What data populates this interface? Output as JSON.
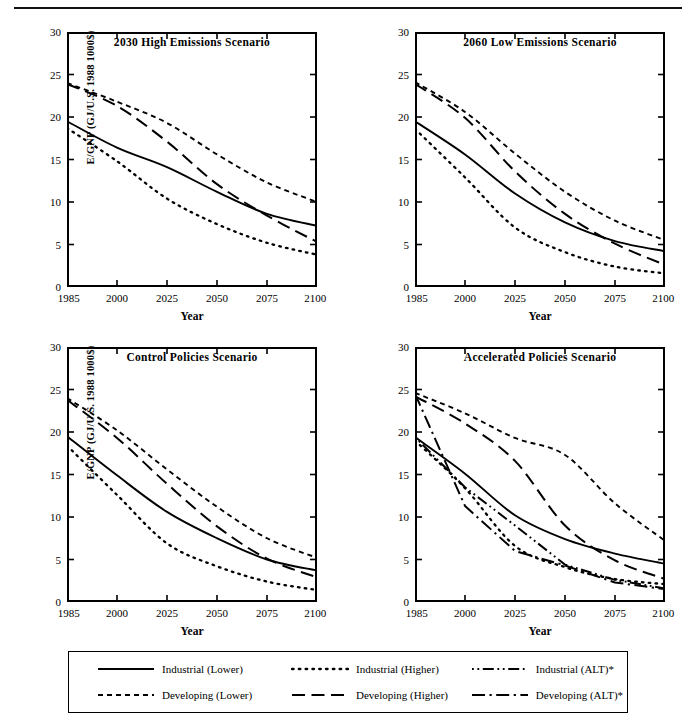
{
  "figure": {
    "axis_label_y": "E/GNP (GJ/U.S. 1988 1000$)",
    "axis_label_x": "Year"
  },
  "legend": {
    "entries": [
      {
        "label": "Industrial (Lower)",
        "style": "solid"
      },
      {
        "label": "Industrial (Higher)",
        "style": "dotted"
      },
      {
        "label": "Industrial (ALT)*",
        "style": "dashdotdot"
      },
      {
        "label": "Developing (Lower)",
        "style": "dashed-short"
      },
      {
        "label": "Developing (Higher)",
        "style": "dashed-long"
      },
      {
        "label": "Developing (ALT)*",
        "style": "dashdot"
      }
    ]
  },
  "chart_data": {
    "type": "line",
    "title": "",
    "xlabel": "Year",
    "ylabel": "E/GNP (GJ/U.S. 1988 1000$)",
    "x": [
      1985,
      2000,
      2025,
      2050,
      2075,
      2100
    ],
    "xticklabels": [
      "1985",
      "2000",
      "2025",
      "2050",
      "2075",
      "2100"
    ],
    "yticks": [
      0,
      5,
      10,
      15,
      20,
      25,
      30
    ],
    "ylim": [
      0,
      30
    ],
    "grid": false,
    "legend_position": "bottom",
    "panels": [
      {
        "title": "2030 High Emissions Scenario",
        "series": [
          {
            "name": "Industrial (Lower)",
            "style": "solid",
            "values": [
              19.5,
              16.4,
              14.1,
              11.2,
              8.6,
              7.2
            ]
          },
          {
            "name": "Industrial (Higher)",
            "style": "dotted",
            "values": [
              18.7,
              14.8,
              10.4,
              7.4,
              5.2,
              3.8
            ]
          },
          {
            "name": "Developing (Lower)",
            "style": "dashed-short",
            "values": [
              24.0,
              21.8,
              19.3,
              15.6,
              12.3,
              10.0
            ]
          },
          {
            "name": "Developing (Higher)",
            "style": "dashed-long",
            "values": [
              23.9,
              21.3,
              17.1,
              12.1,
              8.4,
              5.3
            ]
          }
        ]
      },
      {
        "title": "2060 Low Emissions Scenario",
        "series": [
          {
            "name": "Industrial (Lower)",
            "style": "solid",
            "values": [
              19.5,
              15.6,
              11.0,
              7.6,
              5.4,
              4.2
            ]
          },
          {
            "name": "Industrial (Higher)",
            "style": "dotted",
            "values": [
              18.6,
              12.9,
              7.0,
              4.1,
              2.4,
              1.6
            ]
          },
          {
            "name": "Developing (Lower)",
            "style": "dashed-short",
            "values": [
              24.1,
              20.6,
              15.7,
              11.2,
              7.8,
              5.5
            ]
          },
          {
            "name": "Developing (Higher)",
            "style": "dashed-long",
            "values": [
              23.9,
              19.9,
              13.6,
              8.6,
              5.1,
              2.6
            ]
          }
        ]
      },
      {
        "title": "Control Policies Scenario",
        "series": [
          {
            "name": "Industrial (Lower)",
            "style": "solid",
            "values": [
              19.5,
              14.9,
              10.6,
              7.5,
              5.0,
              3.7
            ]
          },
          {
            "name": "Industrial (Higher)",
            "style": "dotted",
            "values": [
              18.4,
              12.6,
              6.9,
              4.2,
              2.4,
              1.4
            ]
          },
          {
            "name": "Developing (Lower)",
            "style": "dashed-short",
            "values": [
              24.0,
              20.2,
              15.6,
              11.2,
              7.5,
              5.2
            ]
          },
          {
            "name": "Developing (Higher)",
            "style": "dashed-long",
            "values": [
              23.8,
              19.3,
              13.9,
              8.9,
              5.1,
              2.9
            ]
          }
        ]
      },
      {
        "title": "Accelerated Policies Scenario",
        "series": [
          {
            "name": "Industrial (Lower)",
            "style": "solid",
            "values": [
              19.4,
              15.1,
              10.2,
              7.4,
              5.7,
              4.5
            ]
          },
          {
            "name": "Industrial (Higher)",
            "style": "dotted",
            "values": [
              19.0,
              13.4,
              6.6,
              4.1,
              2.7,
              2.1
            ]
          },
          {
            "name": "Industrial (ALT)*",
            "style": "dashdotdot",
            "values": [
              19.4,
              13.5,
              9.0,
              4.4,
              2.6,
              1.6
            ]
          },
          {
            "name": "Developing (Lower)",
            "style": "dashed-short",
            "values": [
              24.6,
              22.2,
              19.3,
              17.3,
              11.6,
              7.2
            ]
          },
          {
            "name": "Developing (Higher)",
            "style": "dashed-long",
            "values": [
              24.2,
              21.0,
              16.6,
              9.0,
              4.9,
              2.7
            ]
          },
          {
            "name": "Developing (ALT)*",
            "style": "dashdot",
            "values": [
              24.5,
              11.3,
              6.0,
              4.3,
              2.3,
              1.5
            ]
          }
        ]
      }
    ]
  }
}
